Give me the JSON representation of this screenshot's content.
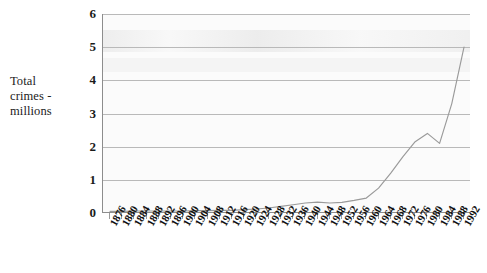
{
  "chart_data": {
    "type": "line",
    "title": "",
    "xlabel": "",
    "ylabel": "Total crimes - millions",
    "ylabel_lines": [
      "Total",
      "crimes -",
      "millions"
    ],
    "ylim": [
      0,
      6
    ],
    "yticks": [
      0,
      1,
      2,
      3,
      4,
      5,
      6
    ],
    "ytick_labels": [
      "0",
      "1",
      "2",
      "3",
      "4",
      "5",
      "6"
    ],
    "grid": true,
    "grid_axis": "y",
    "legend": false,
    "legend_position": "none",
    "line_color": "#9a9a9a",
    "plot_background": "#fbfbfb",
    "axis_color": "#8d8d8d",
    "categories": [
      "1876",
      "1880",
      "1884",
      "1888",
      "1892",
      "1896",
      "1900",
      "1904",
      "1908",
      "1912",
      "1916",
      "1920",
      "1924",
      "1928",
      "1932",
      "1936",
      "1940",
      "1944",
      "1948",
      "1952",
      "1956",
      "1960",
      "1964",
      "1968",
      "1972",
      "1976",
      "1980",
      "1984",
      "1988",
      "1992"
    ],
    "values": [
      0.05,
      0.05,
      0.06,
      0.06,
      0.06,
      0.06,
      0.06,
      0.07,
      0.07,
      0.08,
      0.08,
      0.1,
      0.12,
      0.15,
      0.2,
      0.25,
      0.3,
      0.33,
      0.3,
      0.32,
      0.38,
      0.45,
      0.75,
      1.2,
      1.7,
      2.15,
      2.4,
      2.1,
      3.3,
      5.0
    ],
    "series": [
      {
        "name": "Total crimes",
        "values": [
          0.05,
          0.05,
          0.06,
          0.06,
          0.06,
          0.06,
          0.06,
          0.07,
          0.07,
          0.08,
          0.08,
          0.1,
          0.12,
          0.15,
          0.2,
          0.25,
          0.3,
          0.33,
          0.3,
          0.32,
          0.38,
          0.45,
          0.75,
          1.2,
          1.7,
          2.15,
          2.4,
          2.1,
          3.3,
          5.0
        ]
      }
    ],
    "annotations": []
  }
}
